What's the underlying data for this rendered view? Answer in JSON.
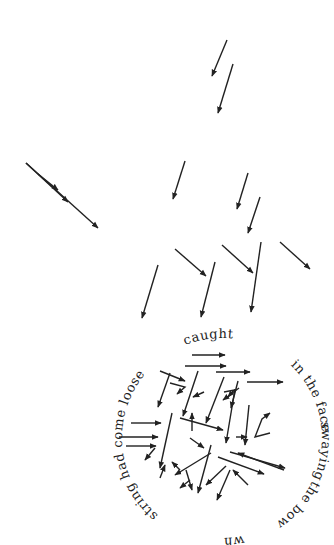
{
  "artwork": {
    "type": "concrete-poem",
    "background": "#ffffff",
    "ink_color": "#222222",
    "circle": {
      "cx": 222,
      "cy": 438,
      "r": 100
    },
    "phrases": [
      {
        "id": "in-the-face",
        "text": "in the face",
        "offset": "62%"
      },
      {
        "id": "swaying",
        "text": "swaying",
        "offset": "72.5%"
      },
      {
        "id": "the-bow",
        "text": "the bow",
        "offset": "82%"
      },
      {
        "id": "whose",
        "text": "whose",
        "offset": "96.5%"
      },
      {
        "id": "string-had-come-loose",
        "text": "string had come loose",
        "offset": "11%"
      },
      {
        "id": "caught",
        "text": "caught",
        "offset": "44%"
      }
    ],
    "scattered_arrows": [
      [
        227,
        40,
        212,
        76
      ],
      [
        233,
        64,
        218,
        113
      ],
      [
        26,
        163,
        98,
        228
      ],
      [
        38,
        174,
        58,
        190
      ],
      [
        26,
        163,
        68,
        202
      ],
      [
        185,
        161,
        173,
        199
      ],
      [
        248,
        173,
        237,
        209
      ],
      [
        260,
        197,
        248,
        233
      ],
      [
        158,
        265,
        142,
        318
      ],
      [
        175,
        249,
        206,
        276
      ],
      [
        215,
        262,
        201,
        317
      ],
      [
        222,
        245,
        253,
        273
      ],
      [
        261,
        242,
        251,
        312
      ],
      [
        280,
        242,
        310,
        269
      ]
    ],
    "circle_arrows": [
      [
        192,
        355,
        225,
        355
      ],
      [
        185,
        366,
        226,
        366
      ],
      [
        216,
        372,
        250,
        372
      ],
      [
        247,
        382,
        283,
        382
      ],
      [
        160,
        371,
        185,
        381
      ],
      [
        170,
        373,
        158,
        407
      ],
      [
        198,
        371,
        183,
        416
      ],
      [
        224,
        377,
        206,
        423
      ],
      [
        238,
        381,
        231,
        408
      ],
      [
        239,
        388,
        223,
        400
      ],
      [
        204,
        392,
        193,
        397
      ],
      [
        131,
        423,
        161,
        423
      ],
      [
        119,
        437,
        158,
        437
      ],
      [
        126,
        446,
        156,
        446
      ],
      [
        155,
        448,
        145,
        460
      ],
      [
        172,
        413,
        160,
        468
      ],
      [
        180,
        418,
        223,
        430
      ],
      [
        190,
        438,
        204,
        448
      ],
      [
        192,
        431,
        192,
        413
      ],
      [
        235,
        389,
        226,
        443
      ],
      [
        236,
        437,
        247,
        437
      ],
      [
        249,
        405,
        245,
        445
      ],
      [
        230,
        452,
        285,
        468
      ],
      [
        284,
        470,
        238,
        453
      ],
      [
        218,
        457,
        264,
        474
      ],
      [
        160,
        478,
        165,
        465
      ],
      [
        180,
        470,
        172,
        462
      ],
      [
        211,
        453,
        175,
        475
      ],
      [
        211,
        445,
        198,
        493
      ],
      [
        190,
        480,
        180,
        488
      ],
      [
        226,
        466,
        206,
        485
      ],
      [
        230,
        470,
        217,
        500
      ],
      [
        248,
        485,
        233,
        470
      ]
    ],
    "circle_polylines": [
      [
        [
          170,
          383
        ],
        [
          185,
          387
        ],
        [
          177,
          394
        ]
      ],
      [
        [
          224,
          392
        ],
        [
          234,
          390
        ],
        [
          228,
          397
        ]
      ],
      [
        [
          270,
          433
        ],
        [
          255,
          437
        ],
        [
          262,
          419
        ],
        [
          270,
          413
        ]
      ],
      [
        [
          186,
          470
        ],
        [
          192,
          490
        ]
      ]
    ]
  }
}
